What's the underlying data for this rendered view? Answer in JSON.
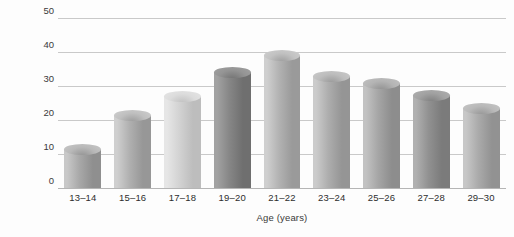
{
  "chart_data": {
    "type": "bar",
    "title": "",
    "xlabel": "Age (years)",
    "ylabel": "Percentage",
    "categories": [
      "13–14",
      "15–16",
      "17–18",
      "19–20",
      "21–22",
      "23–24",
      "25–26",
      "27–28",
      "29–30"
    ],
    "values": [
      11.5,
      21.5,
      27.0,
      34.0,
      39.0,
      33.0,
      31.0,
      27.5,
      23.5
    ],
    "ylim": [
      0,
      50
    ],
    "yticks": [
      0,
      10,
      20,
      30,
      40,
      50
    ],
    "ytick_labels": [
      "0",
      "10",
      "20",
      "30",
      "40",
      "50"
    ],
    "grid": true,
    "legend": "none",
    "bar_style": "cylinder",
    "bar_colors": [
      {
        "light": "#c8c8c8",
        "mid": "#a8a8a8",
        "dark": "#8f8f8f",
        "cap": "#b9b9b9"
      },
      {
        "light": "#cfcfcf",
        "mid": "#b0b0b0",
        "dark": "#979797",
        "cap": "#c0c0c0"
      },
      {
        "light": "#e6e6e6",
        "mid": "#d2d2d2",
        "dark": "#bdbdbd",
        "cap": "#dcdcdc"
      },
      {
        "light": "#a2a2a2",
        "mid": "#868686",
        "dark": "#6f6f6f",
        "cap": "#949494"
      },
      {
        "light": "#cfcfcf",
        "mid": "#b2b2b2",
        "dark": "#9a9a9a",
        "cap": "#c2c2c2"
      },
      {
        "light": "#cbcbcb",
        "mid": "#adadad",
        "dark": "#959595",
        "cap": "#bdbdbd"
      },
      {
        "light": "#c2c2c2",
        "mid": "#a5a5a5",
        "dark": "#8d8d8d",
        "cap": "#b4b4b4"
      },
      {
        "light": "#b0b0b0",
        "mid": "#919191",
        "dark": "#7b7b7b",
        "cap": "#a2a2a2"
      },
      {
        "light": "#c7c7c7",
        "mid": "#aaaaaa",
        "dark": "#929292",
        "cap": "#b9b9b9"
      }
    ]
  },
  "colors": {
    "background": "#fdfdfd",
    "gridline": "#c9c9c9",
    "baseline": "#b5b5b5",
    "text": "#3a3a3a"
  }
}
